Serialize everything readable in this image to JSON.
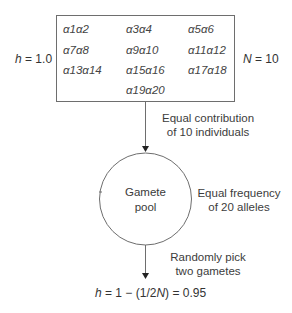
{
  "population": {
    "heterozygosity_label": "h = 1.0",
    "heterozygosity_var": "h",
    "heterozygosity_value": "= 1.0",
    "size_var": "N",
    "size_value": "= 10",
    "genotypes": [
      [
        "α1α2",
        "α3α4",
        "α5α6"
      ],
      [
        "α7α8",
        "α9α10",
        "α11α12"
      ],
      [
        "α13α14",
        "α15α16",
        "α17α18"
      ],
      [
        "",
        "α19α20",
        ""
      ]
    ]
  },
  "step1": {
    "line1": "Equal contribution",
    "line2": "of 10 individuals"
  },
  "gamete_pool": {
    "line1": "Gamete",
    "line2": "pool",
    "note_line1": "Equal frequency",
    "note_line2": "of 20 alleles"
  },
  "step2": {
    "line1": "Randomly pick",
    "line2": "two gametes"
  },
  "result": {
    "var": "h",
    "expr_a": " = 1 − (1/2",
    "var_n": "N",
    "expr_b": ") = 0.95"
  },
  "colors": {
    "line": "#6e6e6e",
    "text": "#3a3a3a"
  }
}
